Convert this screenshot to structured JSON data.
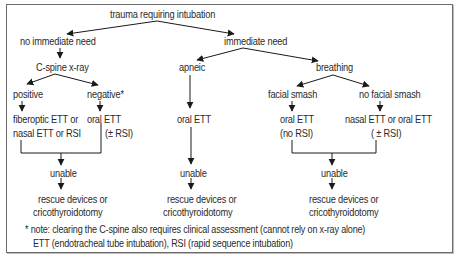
{
  "diagram": {
    "root": "trauma requiring intubation",
    "left_branch": {
      "label": "no immediate need",
      "step": "C-spine x-ray",
      "positive": {
        "label": "positive",
        "action_line1": "fiberoptic ETT or",
        "action_line2": "nasal ETT or RSI"
      },
      "negative": {
        "label": "negative*",
        "action_line1": "oral ETT",
        "action_line2": "(± RSI)"
      },
      "fail": "unable",
      "rescue_line1": "rescue devices or",
      "rescue_line2": "cricothyroidotomy"
    },
    "right_branch": {
      "label": "immediate need",
      "apneic": {
        "label": "apneic",
        "action": "oral ETT",
        "fail": "unable",
        "rescue_line1": "rescue devices or",
        "rescue_line2": "cricothyroidotomy"
      },
      "breathing": {
        "label": "breathing",
        "facial_smash": {
          "label": "facial smash",
          "action_line1": "oral ETT",
          "action_line2": "(no RSI)"
        },
        "no_facial_smash": {
          "label": "no facial smash",
          "action_line1": "nasal ETT or oral ETT",
          "action_line2": "( ± RSI)"
        },
        "fail": "unable",
        "rescue_line1": "rescue devices or",
        "rescue_line2": "cricothyroidotomy"
      }
    },
    "notes": {
      "line1": "* note: clearing the C-spine also requires clinical assessment (cannot rely on x-ray alone)",
      "line2": "ETT (endotracheal tube intubation), RSI (rapid sequence intubation)"
    }
  },
  "colors": {
    "line": "#1a1a1a",
    "text": "#2a2a2a",
    "border": "#6b6b6b"
  }
}
